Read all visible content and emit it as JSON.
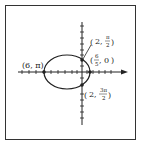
{
  "figure": {
    "type": "polar graph of ellipse",
    "points": [
      {
        "label": "(6, π)",
        "r": "6",
        "theta": "π"
      },
      {
        "label": "(2, π/2)",
        "r": "2",
        "theta_num": "π",
        "theta_den": "2"
      },
      {
        "label": "(6/5, 0)",
        "r_num": "6",
        "r_den": "5",
        "theta": "0"
      },
      {
        "label": "(2, 3π/2)",
        "r": "2",
        "theta_num": "3π",
        "theta_den": "2"
      }
    ],
    "colors": {
      "stroke": "#222222",
      "background": "#ffffff"
    }
  },
  "labels": {
    "left_point": "(6, π)",
    "top_r": "2,",
    "top_num": "π",
    "top_den": "2",
    "right_num": "6",
    "right_den": "5",
    "right_theta": ", 0",
    "bottom_r": "2,",
    "bottom_num": "3π",
    "bottom_den": "2"
  }
}
